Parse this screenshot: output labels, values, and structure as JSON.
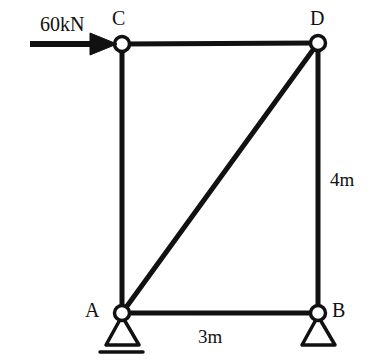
{
  "figure": {
    "type": "structural-truss-diagram",
    "background_color": "#ffffff",
    "line_color": "#111111"
  },
  "load": {
    "label": "60kN",
    "direction": "right",
    "applied_at": "C",
    "arrow_name": "load-arrow-60kn"
  },
  "nodes": [
    {
      "id": "C",
      "label": "C",
      "x": 122,
      "y": 44,
      "label_x": 112,
      "label_y": 8,
      "support": "none"
    },
    {
      "id": "D",
      "label": "D",
      "x": 318,
      "y": 43,
      "label_x": 310,
      "label_y": 8,
      "support": "none"
    },
    {
      "id": "A",
      "label": "A",
      "x": 122,
      "y": 313,
      "label_x": 85,
      "label_y": 300,
      "support": "pin-with-ground"
    },
    {
      "id": "B",
      "label": "B",
      "x": 318,
      "y": 313,
      "label_x": 332,
      "label_y": 300,
      "support": "pin"
    }
  ],
  "members": [
    {
      "name": "member-CD",
      "from": "C",
      "to": "D"
    },
    {
      "name": "member-CA",
      "from": "C",
      "to": "A"
    },
    {
      "name": "member-DB",
      "from": "D",
      "to": "B"
    },
    {
      "name": "member-AB",
      "from": "A",
      "to": "B"
    },
    {
      "name": "member-AD-diagonal",
      "from": "A",
      "to": "D"
    }
  ],
  "dimensions": [
    {
      "name": "dimension-height",
      "label": "4m",
      "value": 4,
      "unit": "m",
      "orientation": "vertical",
      "between": [
        "D",
        "B"
      ]
    },
    {
      "name": "dimension-span",
      "label": "3m",
      "value": 3,
      "unit": "m",
      "orientation": "horizontal",
      "between": [
        "A",
        "B"
      ]
    }
  ],
  "supports": {
    "A": {
      "type": "pinned",
      "has_ground_line": true
    },
    "B": {
      "type": "pinned",
      "has_ground_line": false
    }
  }
}
